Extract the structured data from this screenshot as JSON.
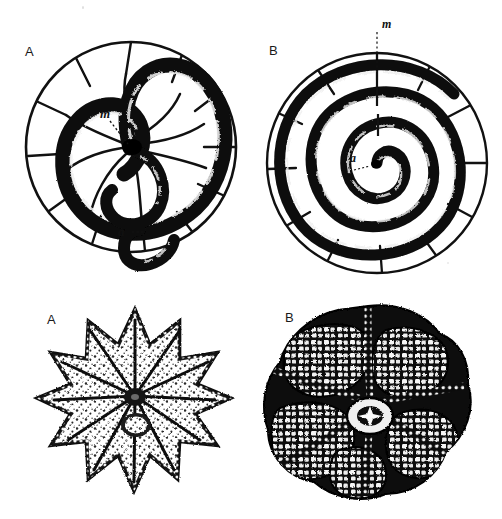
{
  "plate": {
    "kind": "scientific-illustration-plate",
    "background_color": "#ffffff",
    "ink_color": "#000000",
    "rows": 2,
    "columns": 2
  },
  "figures": {
    "top_left": {
      "panel_label": "A",
      "subject": "planispiral-chambered-test-section",
      "annotations": [
        {
          "label": "m",
          "name": "megalospheric-proloculus-marker",
          "leader": "dotted"
        },
        {
          "label": "a",
          "name": "aperture-marker",
          "leader": "dotted"
        }
      ],
      "spiral_turns": 1.75,
      "outer_sutures": 12
    },
    "top_right": {
      "panel_label": "B",
      "subject": "planispiral-chambered-test-section",
      "annotations": [
        {
          "label": "m",
          "name": "megalospheric-proloculus-marker",
          "leader": "dotted"
        },
        {
          "label": "a",
          "name": "aperture-marker",
          "leader": "dotted"
        }
      ],
      "spiral_turns": 4.6,
      "outer_sutures": 12
    },
    "bottom_left": {
      "panel_label": "A",
      "subject": "stellate-spinose-test-exterior",
      "rays": 11,
      "annotations": []
    },
    "bottom_right": {
      "panel_label": "B",
      "subject": "lobate-chambered-test-exterior",
      "lobes": 6,
      "annotations": []
    }
  }
}
